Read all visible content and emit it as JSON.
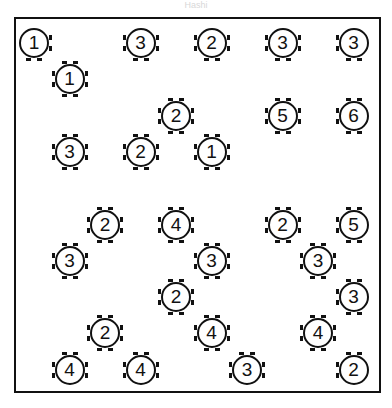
{
  "title": "Hashi",
  "grid": {
    "cols": 10,
    "rows": 10,
    "origin_x": 34,
    "origin_y": 43,
    "step_x": 35.5,
    "step_y": 36.3
  },
  "nodes": [
    {
      "col": 0,
      "row": 0,
      "value": "1"
    },
    {
      "col": 3,
      "row": 0,
      "value": "3"
    },
    {
      "col": 5,
      "row": 0,
      "value": "2"
    },
    {
      "col": 7,
      "row": 0,
      "value": "3"
    },
    {
      "col": 9,
      "row": 0,
      "value": "3"
    },
    {
      "col": 1,
      "row": 1,
      "value": "1"
    },
    {
      "col": 4,
      "row": 2,
      "value": "2"
    },
    {
      "col": 7,
      "row": 2,
      "value": "5"
    },
    {
      "col": 9,
      "row": 2,
      "value": "6"
    },
    {
      "col": 1,
      "row": 3,
      "value": "3"
    },
    {
      "col": 3,
      "row": 3,
      "value": "2"
    },
    {
      "col": 5,
      "row": 3,
      "value": "1"
    },
    {
      "col": 2,
      "row": 5,
      "value": "2"
    },
    {
      "col": 4,
      "row": 5,
      "value": "4"
    },
    {
      "col": 7,
      "row": 5,
      "value": "2"
    },
    {
      "col": 9,
      "row": 5,
      "value": "5"
    },
    {
      "col": 1,
      "row": 6,
      "value": "3"
    },
    {
      "col": 5,
      "row": 6,
      "value": "3"
    },
    {
      "col": 8,
      "row": 6,
      "value": "3"
    },
    {
      "col": 4,
      "row": 7,
      "value": "2"
    },
    {
      "col": 9,
      "row": 7,
      "value": "3"
    },
    {
      "col": 2,
      "row": 8,
      "value": "2"
    },
    {
      "col": 5,
      "row": 8,
      "value": "4"
    },
    {
      "col": 8,
      "row": 8,
      "value": "4"
    },
    {
      "col": 1,
      "row": 9,
      "value": "4"
    },
    {
      "col": 3,
      "row": 9,
      "value": "4"
    },
    {
      "col": 6,
      "row": 9,
      "value": "3"
    },
    {
      "col": 9,
      "row": 9,
      "value": "2"
    }
  ]
}
